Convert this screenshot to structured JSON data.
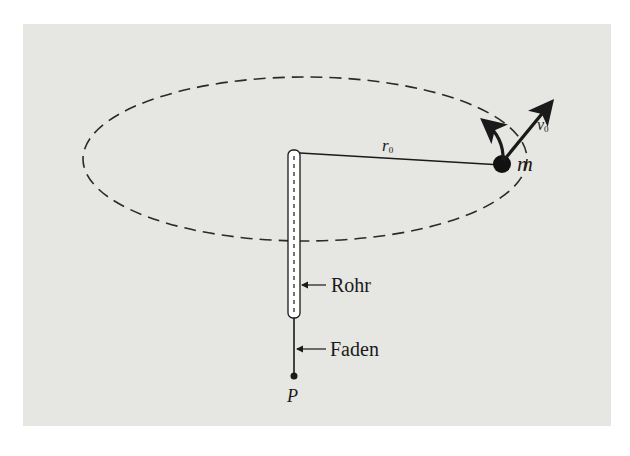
{
  "figure": {
    "background_color": "#e6e6e2",
    "ink_color": "#1a1a1a",
    "labels": {
      "radius": "r",
      "radius_sub": "0",
      "velocity": "v",
      "velocity_sub": "0",
      "mass": "m",
      "tube": "Rohr",
      "thread": "Faden",
      "point": "P"
    }
  }
}
